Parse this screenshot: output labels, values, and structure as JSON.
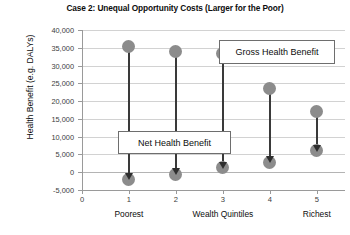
{
  "chart_data": {
    "type": "scatter",
    "title": "Case 2: Unequal Opportunity Costs (Larger for the Poor)",
    "xlabel": "Wealth Quintiles",
    "ylabel": "Health Benefit (e.g. DALYs)",
    "categories": [
      "1",
      "2",
      "3",
      "4",
      "5"
    ],
    "x": [
      1,
      2,
      3,
      4,
      5
    ],
    "xlim": [
      0,
      5.6
    ],
    "ylim": [
      -5000,
      40000
    ],
    "grid": true,
    "legend_position": "none",
    "y_ticks": [
      {
        "value": 40000,
        "label": "40,000"
      },
      {
        "value": 35000,
        "label": "35,000"
      },
      {
        "value": 30000,
        "label": "30,000"
      },
      {
        "value": 25000,
        "label": "25,000"
      },
      {
        "value": 20000,
        "label": "20,000"
      },
      {
        "value": 15000,
        "label": "15,000"
      },
      {
        "value": 10000,
        "label": "10,000"
      },
      {
        "value": 5000,
        "label": "5,000"
      },
      {
        "value": 0,
        "label": "0"
      },
      {
        "value": -5000,
        "label": "-5,000"
      }
    ],
    "x_ticks": [
      {
        "value": 0,
        "label": "0"
      },
      {
        "value": 1,
        "label": "1"
      },
      {
        "value": 2,
        "label": "2"
      },
      {
        "value": 3,
        "label": "3"
      },
      {
        "value": 4,
        "label": "4"
      },
      {
        "value": 5,
        "label": "5"
      }
    ],
    "x_category_labels": [
      {
        "value": 1,
        "label": "Poorest"
      },
      {
        "value": 3,
        "label": "Wealth Quintiles"
      },
      {
        "value": 5,
        "label": "Richest"
      }
    ],
    "series": [
      {
        "name": "Gross Health Benefit",
        "values": [
          35500,
          34000,
          33500,
          23500,
          17000
        ]
      },
      {
        "name": "Net Health Benefit",
        "values": [
          -2000,
          -500,
          1200,
          2800,
          6000
        ]
      }
    ],
    "annotations": [
      {
        "id": "gross",
        "label": "Gross Health Benefit"
      },
      {
        "id": "net",
        "label": "Net Health Benefit"
      }
    ]
  },
  "colors": {
    "marker": "#8c8c8c",
    "stem": "#3a3a3a",
    "arrow": "#2e2e2e",
    "grid": "#d2d2d2",
    "axis": "#9a9a9a",
    "text": "#0d0d0d",
    "background": "#ffffff"
  }
}
